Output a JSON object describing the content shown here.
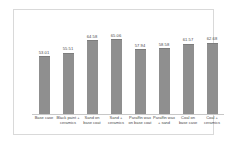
{
  "chart_data": {
    "type": "bar",
    "title": "",
    "subtitle": "",
    "xlabel": "",
    "ylabel": "",
    "grid": false,
    "legend": "none",
    "ylim": [
      0,
      70
    ],
    "axis_baseline_note": "bars truncated; baseline not at zero",
    "categories": [
      "Base case",
      "Black paint + ceramics",
      "Sand on base coat",
      "Sand + ceramics",
      "Paraffin wax on base coat",
      "Paraffin wax + sand",
      "Coal on base case",
      "Coal + ceramics"
    ],
    "values": [
      53.01,
      55.51,
      64.58,
      65.06,
      57.94,
      58.58,
      61.57,
      62.68
    ],
    "value_labels": [
      "53.01",
      "55.51",
      "64.58",
      "65.06",
      "57.94",
      "58.58",
      "61.57",
      "62.68"
    ],
    "bar_color": "#8f8f8f",
    "label_color": "#4a4a4a",
    "background_color": "#ffffff",
    "border_color": "#d9d9d9",
    "bars": [
      {
        "category": "Base case",
        "value": 53.01,
        "label": "53.01",
        "height_pct": 64
      },
      {
        "category": "Black paint + ceramics",
        "value": 55.51,
        "label": "55.51",
        "height_pct": 68
      },
      {
        "category": "Sand on base coat",
        "value": 64.58,
        "label": "64.58",
        "height_pct": 82
      },
      {
        "category": "Sand + ceramics",
        "value": 65.06,
        "label": "65.06",
        "height_pct": 83
      },
      {
        "category": "Paraffin wax on base coat",
        "value": 57.94,
        "label": "57.94",
        "height_pct": 72
      },
      {
        "category": "Paraffin wax + sand",
        "value": 58.58,
        "label": "58.58",
        "height_pct": 73
      },
      {
        "category": "Coal on base case",
        "value": 61.57,
        "label": "61.57",
        "height_pct": 78
      },
      {
        "category": "Coal + ceramics",
        "value": 62.68,
        "label": "62.68",
        "height_pct": 79
      }
    ]
  }
}
